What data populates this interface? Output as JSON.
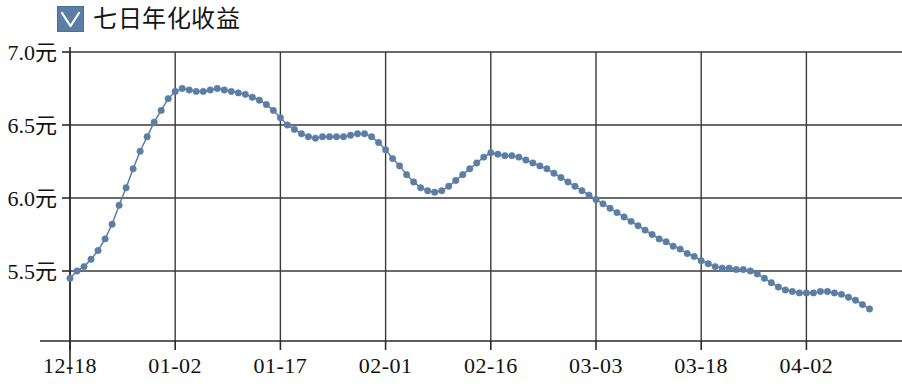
{
  "legend": {
    "label": "七日年化收益",
    "checked": true,
    "checkbox_color": "#5b7ea6",
    "check_icon": "check-icon"
  },
  "chart_data": {
    "type": "line",
    "title": "",
    "subtitle": "",
    "xlabel": "",
    "ylabel": "",
    "series_name": "七日年化收益",
    "series_color": "#5b7ea6",
    "marker": "circle",
    "grid": true,
    "legend_position": "top-left",
    "ylim": [
      5.1,
      7.0
    ],
    "ytick_values": [
      7.0,
      6.5,
      6.0,
      5.5
    ],
    "ytick_labels": [
      "7.0元",
      "6.5元",
      "6.0元",
      "5.5元"
    ],
    "unit_suffix": "元",
    "xtick_labels": [
      "12-18",
      "01-02",
      "01-17",
      "02-01",
      "02-16",
      "03-03",
      "03-18",
      "04-02"
    ],
    "xtick_interval_days": 15,
    "x": [
      "12-18",
      "12-19",
      "12-20",
      "12-21",
      "12-22",
      "12-23",
      "12-24",
      "12-25",
      "12-26",
      "12-27",
      "12-28",
      "12-29",
      "12-30",
      "12-31",
      "01-01",
      "01-02",
      "01-03",
      "01-04",
      "01-05",
      "01-06",
      "01-07",
      "01-08",
      "01-09",
      "01-10",
      "01-11",
      "01-12",
      "01-13",
      "01-14",
      "01-15",
      "01-16",
      "01-17",
      "01-18",
      "01-19",
      "01-20",
      "01-21",
      "01-22",
      "01-23",
      "01-24",
      "01-25",
      "01-26",
      "01-27",
      "01-28",
      "01-29",
      "01-30",
      "01-31",
      "02-01",
      "02-02",
      "02-03",
      "02-04",
      "02-05",
      "02-06",
      "02-07",
      "02-08",
      "02-09",
      "02-10",
      "02-11",
      "02-12",
      "02-13",
      "02-14",
      "02-15",
      "02-16",
      "02-17",
      "02-18",
      "02-19",
      "02-20",
      "02-21",
      "02-22",
      "02-23",
      "02-24",
      "02-25",
      "02-26",
      "02-27",
      "02-28",
      "03-01",
      "03-02",
      "03-03",
      "03-04",
      "03-05",
      "03-06",
      "03-07",
      "03-08",
      "03-09",
      "03-10",
      "03-11",
      "03-12",
      "03-13",
      "03-14",
      "03-15",
      "03-16",
      "03-17",
      "03-18",
      "03-19",
      "03-20",
      "03-21",
      "03-22",
      "03-23",
      "03-24",
      "03-25",
      "03-26",
      "03-27",
      "03-28",
      "03-29",
      "03-30",
      "03-31",
      "04-01",
      "04-02",
      "04-03",
      "04-04",
      "04-05",
      "04-06",
      "04-07",
      "04-08",
      "04-09",
      "04-10",
      "04-11"
    ],
    "values": [
      5.45,
      5.5,
      5.53,
      5.58,
      5.64,
      5.72,
      5.82,
      5.95,
      6.07,
      6.2,
      6.32,
      6.42,
      6.52,
      6.6,
      6.68,
      6.73,
      6.75,
      6.74,
      6.73,
      6.73,
      6.74,
      6.75,
      6.74,
      6.73,
      6.72,
      6.71,
      6.69,
      6.67,
      6.64,
      6.6,
      6.55,
      6.5,
      6.47,
      6.44,
      6.42,
      6.41,
      6.42,
      6.42,
      6.42,
      6.42,
      6.43,
      6.44,
      6.44,
      6.42,
      6.38,
      6.33,
      6.27,
      6.22,
      6.16,
      6.11,
      6.07,
      6.05,
      6.04,
      6.05,
      6.08,
      6.12,
      6.16,
      6.2,
      6.24,
      6.28,
      6.31,
      6.3,
      6.29,
      6.29,
      6.28,
      6.26,
      6.24,
      6.22,
      6.2,
      6.17,
      6.14,
      6.11,
      6.08,
      6.05,
      6.02,
      5.99,
      5.96,
      5.93,
      5.9,
      5.87,
      5.84,
      5.81,
      5.78,
      5.75,
      5.72,
      5.7,
      5.67,
      5.65,
      5.62,
      5.6,
      5.57,
      5.55,
      5.53,
      5.52,
      5.52,
      5.51,
      5.51,
      5.5,
      5.48,
      5.45,
      5.42,
      5.39,
      5.37,
      5.36,
      5.35,
      5.35,
      5.35,
      5.36,
      5.36,
      5.35,
      5.34,
      5.32,
      5.3,
      5.27,
      5.24
    ]
  }
}
